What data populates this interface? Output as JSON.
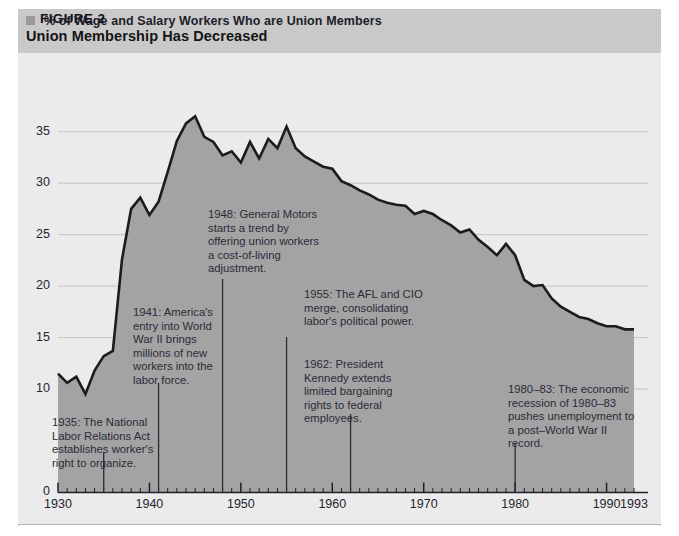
{
  "header": {
    "figure_label": "FIGURE 2",
    "title": "Union Membership Has Decreased",
    "marker_icon": "square-marker-icon",
    "band_color": "#c9c9c9"
  },
  "chart_data": {
    "type": "area",
    "title": "Union Membership Has Decreased",
    "subtitle": "% of Wage and Salary Workers Who are Union Members",
    "xlabel": "",
    "ylabel": "",
    "grid": true,
    "legend_position": "none",
    "xlim": [
      1930,
      1993
    ],
    "ylim": [
      0,
      38
    ],
    "y_ticks": [
      "0",
      "10",
      "15",
      "20",
      "25",
      "30",
      "35"
    ],
    "y_tick_values": [
      0,
      10,
      15,
      20,
      25,
      30,
      35
    ],
    "x_ticks": [
      "1930",
      "1940",
      "1950",
      "1960",
      "1970",
      "1980",
      "1990",
      "1993"
    ],
    "x_tick_values": [
      1930,
      1940,
      1950,
      1960,
      1970,
      1980,
      1990,
      1993
    ],
    "x": [
      1930,
      1931,
      1932,
      1933,
      1934,
      1935,
      1936,
      1937,
      1938,
      1939,
      1940,
      1941,
      1942,
      1943,
      1944,
      1945,
      1946,
      1947,
      1948,
      1949,
      1950,
      1951,
      1952,
      1953,
      1954,
      1955,
      1956,
      1957,
      1958,
      1959,
      1960,
      1961,
      1962,
      1963,
      1964,
      1965,
      1966,
      1967,
      1968,
      1969,
      1970,
      1971,
      1972,
      1973,
      1974,
      1975,
      1976,
      1977,
      1978,
      1979,
      1980,
      1981,
      1982,
      1983,
      1984,
      1985,
      1986,
      1987,
      1988,
      1989,
      1990,
      1991,
      1992,
      1993
    ],
    "values": [
      11.5,
      10.6,
      11.2,
      9.5,
      11.8,
      13.2,
      13.7,
      22.6,
      27.5,
      28.6,
      26.9,
      28.2,
      31.1,
      34.1,
      35.8,
      36.5,
      34.5,
      34.0,
      32.7,
      33.1,
      32.0,
      34.0,
      32.4,
      34.3,
      33.4,
      35.5,
      33.4,
      32.6,
      32.1,
      31.6,
      31.4,
      30.2,
      29.8,
      29.3,
      28.9,
      28.4,
      28.1,
      27.9,
      27.8,
      27.0,
      27.3,
      27.0,
      26.4,
      25.9,
      25.2,
      25.5,
      24.5,
      23.8,
      23.0,
      24.1,
      23.0,
      20.6,
      20.0,
      20.1,
      18.8,
      18.0,
      17.5,
      17.0,
      16.8,
      16.4,
      16.1,
      16.1,
      15.8,
      15.8
    ],
    "fill_color": "#a3a3a3",
    "line_color": "#1c1c1c",
    "plot_background": "#ebebeb",
    "annotations": [
      {
        "id": "annot-1935",
        "year": 1935,
        "text": "1935: The National\nLabor Relations Act\nestablishes worker's\nright to organize."
      },
      {
        "id": "annot-1941",
        "year": 1941,
        "text": "1941: America's\nentry into World\nWar II brings\nmillions of new\nworkers into the\nlabor force."
      },
      {
        "id": "annot-1948",
        "year": 1948,
        "text": "1948: General Motors\nstarts a trend by\noffering union workers\na cost-of-living\nadjustment."
      },
      {
        "id": "annot-1955",
        "year": 1955,
        "text": "1955: The AFL and CIO\nmerge, consolidating\nlabor's political power."
      },
      {
        "id": "annot-1962",
        "year": 1962,
        "text": "1962: President\nKennedy extends\nlimited bargaining\nrights to federal\nemployees."
      },
      {
        "id": "annot-1980",
        "year": 1980,
        "text": "1980–83: The economic\nrecession of 1980–83\npushes unemployment to\na post–World War II\nrecord."
      }
    ]
  }
}
